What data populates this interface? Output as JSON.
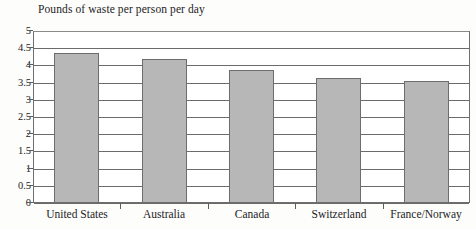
{
  "chart_data": {
    "type": "bar",
    "title": "Pounds of waste per person per day",
    "xlabel": "",
    "ylabel": "",
    "ylim": [
      0,
      5
    ],
    "ytick_step": 0.5,
    "yticks": [
      "5",
      "4.5",
      "4",
      "3.5",
      "3",
      "2.5",
      "2",
      "1.5",
      "1",
      "0.5",
      "0"
    ],
    "grid": true,
    "legend": "none",
    "categories": [
      "United States",
      "Australia",
      "Canada",
      "Switzerland",
      "France/Norway"
    ],
    "values": [
      4.35,
      4.18,
      3.87,
      3.64,
      3.56
    ],
    "bar_color": "#b7b7b7",
    "bar_border_color": "#6d6d6d",
    "axis_color": "#6b6b6b",
    "background_color": "#ffffff"
  }
}
